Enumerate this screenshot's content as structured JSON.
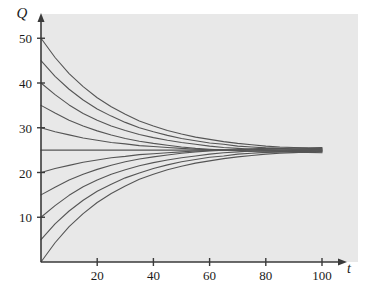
{
  "chart_data": {
    "type": "line",
    "title": "",
    "xlabel": "t",
    "ylabel": "Q",
    "xlim": [
      0,
      112
    ],
    "ylim": [
      0,
      54
    ],
    "xticks": [
      20,
      40,
      60,
      80,
      100
    ],
    "yticks": [
      10,
      20,
      30,
      40,
      50
    ],
    "xtick_labels": [
      "20",
      "40",
      "60",
      "80",
      "100"
    ],
    "ytick_labels": [
      "10",
      "20",
      "30",
      "40",
      "50"
    ],
    "grid": false,
    "legend": "none",
    "equilibrium": 25,
    "annotation": "Solution curves of a first-order linear ODE all converging to the equilibrium value Q = 25 as t increases.",
    "model": "Q(t) = 25 + (Q0 - 25) * exp(-k*t), k = 0.038",
    "series": [
      {
        "name": "Q0 = 50",
        "initial": 50,
        "x": [
          0,
          5,
          10,
          15,
          20,
          25,
          30,
          35,
          40,
          45,
          50,
          55,
          60,
          65,
          70,
          75,
          80,
          85,
          90,
          95,
          100
        ],
        "values": [
          50.0,
          45.7,
          42.1,
          39.2,
          36.7,
          34.7,
          33.0,
          31.5,
          30.4,
          29.4,
          28.6,
          27.9,
          27.4,
          26.9,
          26.5,
          26.2,
          25.9,
          25.7,
          25.6,
          25.4,
          25.3
        ]
      },
      {
        "name": "Q0 = 45",
        "initial": 45,
        "x": [
          0,
          5,
          10,
          15,
          20,
          25,
          30,
          35,
          40,
          45,
          50,
          55,
          60,
          65,
          70,
          75,
          80,
          85,
          90,
          95,
          100
        ],
        "values": [
          45.0,
          41.5,
          38.6,
          36.2,
          34.2,
          32.6,
          31.2,
          30.0,
          29.1,
          28.3,
          27.6,
          27.1,
          26.6,
          26.3,
          25.9,
          25.7,
          25.5,
          25.4,
          25.2,
          25.2,
          25.1
        ]
      },
      {
        "name": "Q0 = 40",
        "initial": 40,
        "x": [
          0,
          5,
          10,
          15,
          20,
          25,
          30,
          35,
          40,
          45,
          50,
          55,
          60,
          65,
          70,
          75,
          80,
          85,
          90,
          95,
          100
        ],
        "values": [
          40.0,
          37.4,
          35.1,
          33.2,
          31.7,
          30.4,
          29.4,
          28.5,
          27.8,
          27.2,
          26.7,
          26.3,
          25.9,
          25.6,
          25.4,
          25.2,
          25.1,
          25.0,
          24.9,
          24.9,
          24.8
        ]
      },
      {
        "name": "Q0 = 35",
        "initial": 35,
        "x": [
          0,
          5,
          10,
          15,
          20,
          25,
          30,
          35,
          40,
          45,
          50,
          55,
          60,
          65,
          70,
          75,
          80,
          85,
          90,
          95,
          100
        ],
        "values": [
          35.0,
          33.3,
          31.7,
          30.4,
          29.3,
          28.4,
          27.6,
          27.0,
          26.5,
          26.1,
          25.7,
          25.4,
          25.2,
          25.0,
          24.9,
          24.7,
          24.6,
          24.6,
          24.5,
          24.5,
          24.4
        ]
      },
      {
        "name": "Q0 = 30",
        "initial": 30,
        "x": [
          0,
          5,
          10,
          15,
          20,
          25,
          30,
          35,
          40,
          45,
          50,
          55,
          60,
          65,
          70,
          75,
          80,
          85,
          90,
          95,
          100
        ],
        "values": [
          30.0,
          29.1,
          28.4,
          27.7,
          27.2,
          26.7,
          26.4,
          26.0,
          25.8,
          25.6,
          25.4,
          25.2,
          25.1,
          25.0,
          24.9,
          24.8,
          24.8,
          24.7,
          24.7,
          24.7,
          24.6
        ]
      },
      {
        "name": "Q0 = 25 (equilibrium)",
        "initial": 25,
        "x": [
          0,
          100
        ],
        "values": [
          25.0,
          25.0
        ]
      },
      {
        "name": "Q0 = 20",
        "initial": 20,
        "x": [
          0,
          5,
          10,
          15,
          20,
          25,
          30,
          35,
          40,
          45,
          50,
          55,
          60,
          65,
          70,
          75,
          80,
          85,
          90,
          95,
          100
        ],
        "values": [
          20.0,
          20.9,
          21.6,
          22.3,
          22.8,
          23.3,
          23.6,
          24.0,
          24.2,
          24.4,
          24.6,
          24.8,
          24.9,
          25.0,
          25.1,
          25.2,
          25.2,
          25.3,
          25.3,
          25.3,
          25.4
        ]
      },
      {
        "name": "Q0 = 15",
        "initial": 15,
        "x": [
          0,
          5,
          10,
          15,
          20,
          25,
          30,
          35,
          40,
          45,
          50,
          55,
          60,
          65,
          70,
          75,
          80,
          85,
          90,
          95,
          100
        ],
        "values": [
          15.0,
          16.7,
          18.3,
          19.6,
          20.7,
          21.6,
          22.4,
          23.0,
          23.5,
          23.9,
          24.3,
          24.6,
          24.8,
          25.0,
          25.1,
          25.3,
          25.4,
          25.4,
          25.5,
          25.5,
          25.6
        ]
      },
      {
        "name": "Q0 = 10",
        "initial": 10,
        "x": [
          0,
          5,
          10,
          15,
          20,
          25,
          30,
          35,
          40,
          45,
          50,
          55,
          60,
          65,
          70,
          75,
          80,
          85,
          90,
          95,
          100
        ],
        "values": [
          10.0,
          12.6,
          14.9,
          16.8,
          18.3,
          19.6,
          20.6,
          21.5,
          22.2,
          22.8,
          23.3,
          23.7,
          24.1,
          24.4,
          24.6,
          24.8,
          24.9,
          25.0,
          25.1,
          25.1,
          25.2
        ]
      },
      {
        "name": "Q0 = 5",
        "initial": 5,
        "x": [
          0,
          5,
          10,
          15,
          20,
          25,
          30,
          35,
          40,
          45,
          50,
          55,
          60,
          65,
          70,
          75,
          80,
          85,
          90,
          95,
          100
        ],
        "values": [
          5.0,
          8.5,
          11.4,
          13.8,
          15.8,
          17.4,
          18.8,
          19.9,
          20.9,
          21.7,
          22.4,
          22.9,
          23.4,
          23.7,
          24.1,
          24.3,
          24.5,
          24.6,
          24.8,
          24.8,
          24.9
        ]
      },
      {
        "name": "Q0 = 0",
        "initial": 0,
        "x": [
          0,
          5,
          10,
          15,
          20,
          25,
          30,
          35,
          40,
          45,
          50,
          55,
          60,
          65,
          70,
          75,
          80,
          85,
          90,
          95,
          100
        ],
        "values": [
          0.0,
          4.3,
          7.9,
          10.8,
          13.3,
          15.3,
          17.0,
          18.5,
          19.6,
          20.6,
          21.4,
          22.1,
          22.6,
          23.1,
          23.5,
          23.8,
          24.1,
          24.3,
          24.4,
          24.6,
          24.7
        ]
      }
    ]
  },
  "style": {
    "plot_background": "#e8e8e8",
    "page_background": "#ffffff",
    "curve_color": "#555555",
    "axis_color": "#3a3a3a",
    "text_color": "#1a1a1a"
  }
}
